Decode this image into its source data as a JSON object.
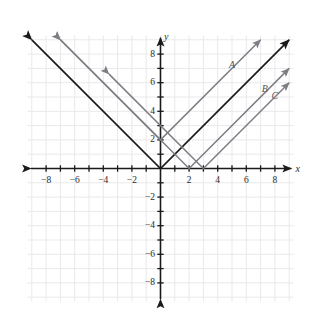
{
  "figure": {
    "kind": "coordinate-plane-graph",
    "background_color": "#ffffff",
    "grid_color": "#e9e9ec",
    "axis_color": "#1a1a1a",
    "width": 318,
    "height": 327
  },
  "axes": {
    "x_name": "x",
    "y_name": "y",
    "x_ticks": [
      {
        "value": -8,
        "label": "−8"
      },
      {
        "value": -6,
        "label": "−6"
      },
      {
        "value": -4,
        "label": "−4"
      },
      {
        "value": -2,
        "label": "−2"
      },
      {
        "value": 2,
        "label": "2"
      },
      {
        "value": 4,
        "label": "4"
      },
      {
        "value": 6,
        "label": "6"
      },
      {
        "value": 8,
        "label": "8"
      }
    ],
    "y_ticks": [
      {
        "value": 8,
        "label": "8"
      },
      {
        "value": 6,
        "label": "6"
      },
      {
        "value": 4,
        "label": "4"
      },
      {
        "value": 2,
        "label": "2"
      },
      {
        "value": -2,
        "label": "−2"
      },
      {
        "value": -4,
        "label": "−4"
      },
      {
        "value": -6,
        "label": "−6"
      },
      {
        "value": -8,
        "label": "−8"
      }
    ]
  },
  "curve_labels": [
    {
      "id": "A",
      "text": "A",
      "x": 5.0,
      "y": 7.6
    },
    {
      "id": "B",
      "text": "B",
      "x": 7.3,
      "y": 5.9
    },
    {
      "id": "C",
      "text": "C",
      "x": 8.0,
      "y": 5.4
    }
  ],
  "chart_data": {
    "type": "line",
    "title": "",
    "xlabel": "x",
    "ylabel": "y",
    "xlim": [
      -9.2,
      9.2
    ],
    "ylim": [
      -9.2,
      9.2
    ],
    "grid": true,
    "legend": "inline-labels",
    "series": [
      {
        "name": "unlabeled",
        "equation": "y = |x|",
        "color": "#1a1a1a",
        "vertex": [
          0,
          0
        ],
        "slope": 1,
        "arrow_both_ends": true,
        "points": [
          [
            -9.0,
            9.0
          ],
          [
            0,
            0
          ],
          [
            9.0,
            9.0
          ]
        ]
      },
      {
        "name": "A",
        "equation": "y = |x| + 2",
        "color": "#7d7d84",
        "vertex": [
          0,
          2
        ],
        "slope": 1,
        "arrow_both_ends": true,
        "points": [
          [
            -7.0,
            9.0
          ],
          [
            0,
            2
          ],
          [
            7.0,
            9.0
          ]
        ]
      },
      {
        "name": "B",
        "equation": "y = |x − 2|",
        "color": "#7d7d84",
        "vertex": [
          2,
          0
        ],
        "slope": 1,
        "arrow_both_ends": true,
        "points": [
          [
            -7.0,
            9.0
          ],
          [
            2,
            0
          ],
          [
            9.0,
            7.0
          ]
        ]
      },
      {
        "name": "C",
        "equation": "y = |x − 3|",
        "color": "#7d7d84",
        "vertex": [
          3,
          0
        ],
        "slope": 1,
        "arrow_both_ends": true,
        "points": [
          [
            -3.6,
            6.6
          ],
          [
            3,
            0
          ],
          [
            9.0,
            6.0
          ]
        ]
      }
    ]
  }
}
